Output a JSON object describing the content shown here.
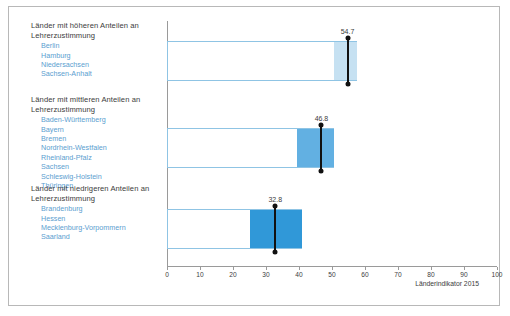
{
  "footer": {
    "source": "Länderindikator 2015"
  },
  "chart_data": {
    "type": "bar",
    "title": "",
    "xlabel": "",
    "ylabel": "",
    "xlim": [
      0,
      100
    ],
    "xticks": [
      0,
      10,
      20,
      30,
      40,
      50,
      60,
      70,
      80,
      90,
      100
    ],
    "grid": false,
    "legend": "none",
    "orientation": "horizontal",
    "categories": [
      "Länder mit höheren Anteilen an Lehrerzustimmung",
      "Länder mit mittleren Anteilen an Lehrerzustimmung",
      "Länder mit niedrigeren Anteilen an Lehrerzustimmung"
    ],
    "values": [
      54.7,
      46.8,
      32.8
    ],
    "series": [
      {
        "name": "Anteil Lehrerzustimmung",
        "values": [
          54.7,
          46.8,
          32.8
        ]
      }
    ],
    "groups": [
      {
        "header_line1": "Länder mit höheren Anteilen an",
        "header_line2": "Lehrerzustimmung",
        "value": 54.7,
        "value_label": "54.7",
        "fill_start": 50.5,
        "fill_end": 57.5,
        "fill_color": "#c6e1f2",
        "states": [
          "Berlin",
          "Hamburg",
          "Niedersachsen",
          "Sachsen-Anhalt"
        ]
      },
      {
        "header_line1": "Länder mit mittleren Anteilen an",
        "header_line2": "Lehrerzustimmung",
        "value": 46.8,
        "value_label": "46.8",
        "fill_start": 39.5,
        "fill_end": 50.5,
        "fill_color": "#62b0e2",
        "states": [
          "Baden-Württemberg",
          "Bayern",
          "Bremen",
          "Nordrhein-Westfalen",
          "Rheinland-Pfalz",
          "Sachsen",
          "Schleswig-Holstein",
          "Thüringen"
        ]
      },
      {
        "header_line1": "Länder mit niedrigeren Anteilen an",
        "header_line2": "Lehrerzustimmung",
        "value": 32.8,
        "value_label": "32.8",
        "fill_start": 25.0,
        "fill_end": 41.0,
        "fill_color": "#3098d8",
        "states": [
          "Brandenburg",
          "Hessen",
          "Mecklenburg-Vorpommern",
          "Saarland"
        ]
      }
    ],
    "colors": {
      "bar_outline": "#8fc4e4",
      "axis": "#9a9a9a",
      "marker": "#111111",
      "state_text": "#5b9ecf",
      "header_text": "#3c3c3c"
    }
  }
}
